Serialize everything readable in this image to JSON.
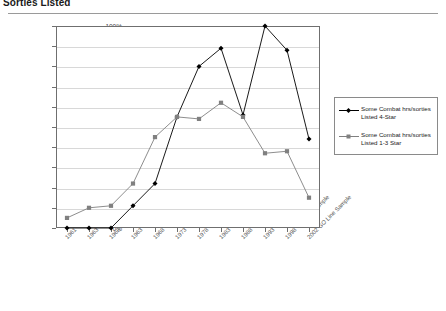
{
  "page": {
    "title": "Sorties Listed"
  },
  "legend": {
    "position": "right",
    "items": [
      {
        "label_line1": "Some Combat hrs/sorties",
        "label_line2": "Listed 4-Star",
        "color": "#000000",
        "marker": "diamond"
      },
      {
        "label_line1": "Some Combat hrs/sorties",
        "label_line2": "Listed 1-3 Star",
        "color": "#808080",
        "marker": "square"
      }
    ]
  },
  "chart_data": {
    "type": "line",
    "title": "Sorties Listed",
    "xlabel": "",
    "ylabel": "",
    "ylim": [
      0,
      100
    ],
    "grid": true,
    "legend_position": "right",
    "categories": [
      "1961 GO Line Sample",
      "1963 GO Line Sample",
      "1968 GO Line Sample",
      "1963 GO Line Sample",
      "1968 GO Line Sample",
      "1973 GO Line Sample",
      "1978 GO Line Sample",
      "1983 GO Line Sample",
      "1988 GO Line Sample",
      "1993 GO Line Sample",
      "1998 GO Line Sample",
      "2002 GO Line Sample"
    ],
    "ytick_labels": [
      "0%",
      "10%",
      "20%",
      "30%",
      "40%",
      "50%",
      "60%",
      "70%",
      "80%",
      "90%",
      "100%"
    ],
    "ytick_values": [
      0,
      10,
      20,
      30,
      40,
      50,
      60,
      70,
      80,
      90,
      100
    ],
    "series": [
      {
        "name": "Some Combat hrs/sortles Listed 4-Star",
        "color": "#000000",
        "marker": "diamond",
        "values": [
          0,
          0,
          0,
          11,
          22,
          55,
          80,
          89,
          56,
          100,
          88,
          44
        ]
      },
      {
        "name": "Some Combat hrs/sortles Listed 1-3 Star",
        "color": "#808080",
        "marker": "square",
        "values": [
          5,
          10,
          11,
          22,
          45,
          55,
          54,
          62,
          55,
          37,
          38,
          15
        ]
      }
    ]
  }
}
